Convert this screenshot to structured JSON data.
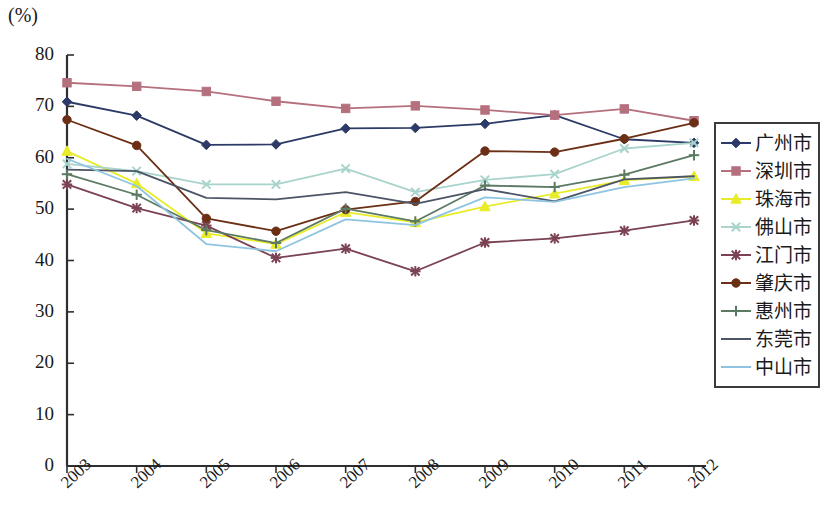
{
  "chart_data": {
    "type": "line",
    "title": "",
    "xlabel": "",
    "ylabel": "(%)",
    "unit_label": "(%)",
    "categories": [
      "2003",
      "2004",
      "2005",
      "2006",
      "2007",
      "2008",
      "2009",
      "2010",
      "2011",
      "2012"
    ],
    "ylim": [
      0,
      80
    ],
    "ytick_labels": [
      "0",
      "10",
      "20",
      "30",
      "40",
      "50",
      "60",
      "70",
      "80"
    ],
    "yticks": [
      0,
      10,
      20,
      30,
      40,
      50,
      60,
      70,
      80
    ],
    "grid": false,
    "legend_position": "right",
    "series": [
      {
        "name": "广州市",
        "color": "#2b3a66",
        "marker": "diamond",
        "values": [
          70.9,
          68.2,
          62.5,
          62.6,
          65.7,
          65.8,
          66.6,
          68.3,
          63.6,
          62.9
        ]
      },
      {
        "name": "深圳市",
        "color": "#b5707e",
        "marker": "square",
        "values": [
          74.6,
          73.9,
          72.9,
          71.0,
          69.6,
          70.1,
          69.3,
          68.3,
          69.5,
          67.2
        ]
      },
      {
        "name": "珠海市",
        "color": "#e8ec28",
        "marker": "triangle",
        "values": [
          61.3,
          55.0,
          45.3,
          43.2,
          49.4,
          47.4,
          50.5,
          53.0,
          55.6,
          56.4
        ]
      },
      {
        "name": "佛山市",
        "color": "#a8d4cc",
        "marker": "cross",
        "values": [
          58.8,
          57.4,
          54.8,
          54.8,
          57.9,
          53.3,
          55.7,
          56.8,
          61.8,
          62.9
        ]
      },
      {
        "name": "江门市",
        "color": "#7a4252",
        "marker": "star",
        "values": [
          54.8,
          50.2,
          46.8,
          40.5,
          42.3,
          37.9,
          43.5,
          44.3,
          45.8,
          47.8
        ]
      },
      {
        "name": "肇庆市",
        "color": "#6b2f16",
        "marker": "circle",
        "values": [
          67.4,
          62.4,
          48.2,
          45.7,
          49.9,
          51.5,
          61.3,
          61.1,
          63.7,
          66.8
        ]
      },
      {
        "name": "惠州市",
        "color": "#5c7a63",
        "marker": "plus",
        "values": [
          56.8,
          52.8,
          45.9,
          43.4,
          50.1,
          47.6,
          54.6,
          54.3,
          56.7,
          60.5
        ]
      },
      {
        "name": "东莞市",
        "color": "#4c5566",
        "marker": "line",
        "values": [
          57.7,
          57.4,
          52.2,
          51.9,
          53.3,
          51.0,
          53.9,
          51.5,
          55.8,
          56.4
        ]
      },
      {
        "name": "中山市",
        "color": "#8fc4e0",
        "marker": "line",
        "values": [
          59.8,
          54.5,
          43.2,
          41.8,
          48.0,
          46.9,
          52.3,
          51.4,
          54.3,
          56.0
        ]
      }
    ]
  }
}
